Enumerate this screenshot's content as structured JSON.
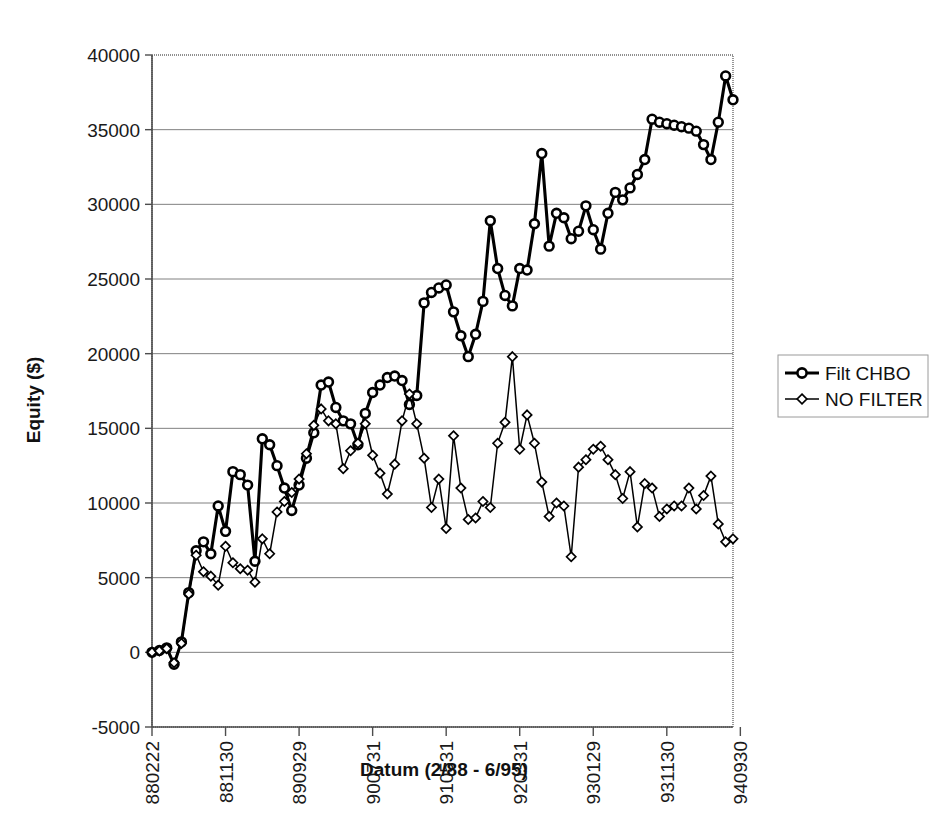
{
  "chart_data": {
    "type": "line",
    "title": "",
    "xlabel": "Datum (2/88 - 6/95)",
    "ylabel": "Equity ($)",
    "ylim": [
      -5000,
      40000
    ],
    "ytick_step": 5000,
    "yticks": [
      "-5000",
      "0",
      "5000",
      "10000",
      "15000",
      "20000",
      "25000",
      "30000",
      "35000",
      "40000"
    ],
    "xticks": [
      "880222",
      "881130",
      "890929",
      "900731",
      "910531",
      "920331",
      "930129",
      "931130",
      "940930"
    ],
    "xtick_indices": [
      0,
      10,
      20,
      30,
      40,
      50,
      60,
      70,
      80
    ],
    "grid": "horizontal",
    "legend_position": "right",
    "n_points": 89,
    "series": [
      {
        "name": "Filt CHBO",
        "marker": "circle",
        "line_weight": "thick",
        "values": [
          0,
          120,
          300,
          -800,
          700,
          4000,
          6800,
          7400,
          6600,
          9800,
          8100,
          12100,
          11900,
          11200,
          6100,
          14300,
          13900,
          12500,
          11000,
          9500,
          11200,
          13000,
          14700,
          17900,
          18100,
          16400,
          15500,
          15300,
          13900,
          16000,
          17400,
          17900,
          18400,
          18500,
          18200,
          16600,
          17200,
          23400,
          24100,
          24400,
          24600,
          22800,
          21200,
          19800,
          21300,
          23500,
          28900,
          25700,
          23900,
          23200,
          25700,
          25600,
          28700,
          33400,
          27200,
          29400,
          29100,
          27700,
          28200,
          29900,
          28300,
          27000,
          29400,
          30800,
          30300,
          31100,
          32000,
          33000,
          35700,
          35500,
          35400,
          35300,
          35200,
          35100,
          34900,
          34000,
          33000,
          35500,
          38600,
          37000
        ]
      },
      {
        "name": "NO FILTER",
        "marker": "diamond",
        "line_weight": "thin",
        "values": [
          0,
          100,
          250,
          -700,
          600,
          3900,
          6500,
          5400,
          5100,
          4500,
          7100,
          6000,
          5600,
          5500,
          4700,
          7600,
          6600,
          9400,
          10100,
          10700,
          11600,
          13300,
          15200,
          16300,
          15500,
          15300,
          12300,
          13500,
          14000,
          15300,
          13200,
          12000,
          10600,
          12600,
          15500,
          17300,
          15300,
          13000,
          9700,
          11600,
          8300,
          14500,
          11000,
          8900,
          9000,
          10100,
          9700,
          14000,
          15400,
          19800,
          13600,
          15900,
          14000,
          11400,
          9100,
          10000,
          9800,
          6400,
          12400,
          12900,
          13600,
          13800,
          12900,
          11900,
          10300,
          12100,
          8400,
          11300,
          11000,
          9100,
          9600,
          9800,
          9800,
          11000,
          9600,
          10500,
          11800,
          8600,
          7400,
          7600
        ]
      }
    ]
  },
  "legend": {
    "entries": [
      {
        "label": "Filt CHBO",
        "marker": "circle-marker",
        "weight": "thick"
      },
      {
        "label": "NO FILTER",
        "marker": "diamond-marker",
        "weight": "thin"
      }
    ]
  }
}
